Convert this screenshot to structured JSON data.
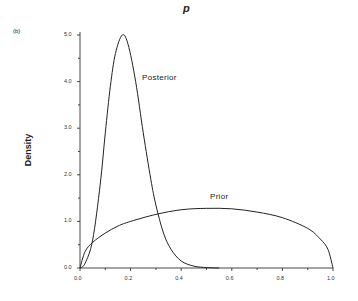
{
  "chart_data": {
    "type": "line",
    "title": "p",
    "panel_label": "(b)",
    "xlabel": "",
    "ylabel": "Density",
    "xlim": [
      0.0,
      1.0
    ],
    "ylim": [
      0.0,
      5.0
    ],
    "x_ticks": [
      "0.0",
      "0.2",
      "0.4",
      "0.6",
      "0.8",
      "1.0"
    ],
    "y_ticks": [
      "0.0",
      "1.0",
      "2.0",
      "3.0",
      "4.0",
      "5.0"
    ],
    "grid": false,
    "series": [
      {
        "name": "Posterior",
        "x": [
          0.0,
          0.02,
          0.05,
          0.08,
          0.1,
          0.12,
          0.14,
          0.167,
          0.19,
          0.22,
          0.25,
          0.28,
          0.3,
          0.33,
          0.36,
          0.4,
          0.45,
          0.5,
          0.55
        ],
        "values": [
          0.0,
          0.1,
          0.6,
          1.8,
          2.9,
          3.9,
          4.6,
          5.0,
          4.8,
          4.0,
          2.9,
          1.9,
          1.35,
          0.75,
          0.4,
          0.15,
          0.04,
          0.01,
          0.0
        ]
      },
      {
        "name": "Prior",
        "x": [
          0.0,
          0.02,
          0.05,
          0.1,
          0.15,
          0.2,
          0.3,
          0.4,
          0.5,
          0.6,
          0.7,
          0.8,
          0.9,
          0.95,
          0.98,
          1.0
        ],
        "values": [
          0.0,
          0.35,
          0.55,
          0.75,
          0.9,
          1.0,
          1.15,
          1.25,
          1.28,
          1.27,
          1.2,
          1.08,
          0.85,
          0.62,
          0.4,
          0.0
        ]
      }
    ],
    "annotations": [
      {
        "text": "Posterior",
        "x": 0.24,
        "y": 4.0
      },
      {
        "text": "Prior",
        "x": 0.5,
        "y": 1.45
      }
    ]
  },
  "labels": {
    "title": "p",
    "panel": "(b)",
    "ylabel": "Density",
    "posterior": "Posterior",
    "prior": "Prior"
  }
}
